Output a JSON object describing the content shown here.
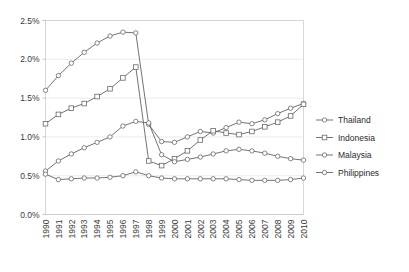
{
  "chart_data": {
    "type": "line",
    "title": "",
    "xlabel": "",
    "ylabel": "",
    "grid": true,
    "legend_position": "right",
    "x": [
      "1990",
      "1991",
      "1992",
      "1993",
      "1994",
      "1995",
      "1996",
      "1997",
      "1998",
      "1999",
      "2000",
      "2001",
      "2002",
      "2003",
      "2004",
      "2005",
      "2006",
      "2007",
      "2008",
      "2009",
      "2010"
    ],
    "categories": [
      "1990",
      "1991",
      "1992",
      "1993",
      "1994",
      "1995",
      "1996",
      "1997",
      "1998",
      "1999",
      "2000",
      "2001",
      "2002",
      "2003",
      "2004",
      "2005",
      "2006",
      "2007",
      "2008",
      "2009",
      "2010"
    ],
    "ylim": [
      0.0,
      2.5
    ],
    "ytick_labels": [
      "0.0%",
      "0.5%",
      "1.0%",
      "1.5%",
      "2.0%",
      "2.5%"
    ],
    "ytick_values": [
      0.0,
      0.5,
      1.0,
      1.5,
      2.0,
      2.5
    ],
    "yunit": "%",
    "series": [
      {
        "name": "Thailand",
        "marker": "circle",
        "values": [
          1.6,
          1.79,
          1.95,
          2.09,
          2.21,
          2.3,
          2.35,
          2.34,
          1.16,
          0.94,
          0.93,
          1.0,
          1.07,
          1.05,
          1.12,
          1.19,
          1.17,
          1.22,
          1.3,
          1.37,
          1.43
        ]
      },
      {
        "name": "Indonesia",
        "marker": "square",
        "values": [
          1.17,
          1.29,
          1.37,
          1.43,
          1.52,
          1.62,
          1.76,
          1.9,
          0.69,
          0.63,
          0.72,
          0.82,
          0.96,
          1.08,
          1.05,
          1.03,
          1.07,
          1.13,
          1.19,
          1.27,
          1.42
        ]
      },
      {
        "name": "Malaysia",
        "marker": "circle",
        "values": [
          0.56,
          0.69,
          0.78,
          0.86,
          0.93,
          1.0,
          1.14,
          1.2,
          1.18,
          0.77,
          0.68,
          0.71,
          0.74,
          0.78,
          0.82,
          0.84,
          0.82,
          0.79,
          0.75,
          0.72,
          0.7
        ]
      },
      {
        "name": "Philippines",
        "marker": "circle",
        "values": [
          0.52,
          0.45,
          0.46,
          0.47,
          0.47,
          0.48,
          0.5,
          0.55,
          0.5,
          0.47,
          0.46,
          0.46,
          0.46,
          0.46,
          0.46,
          0.45,
          0.44,
          0.44,
          0.44,
          0.45,
          0.47
        ]
      }
    ],
    "legend": [
      "Thailand",
      "Indonesia",
      "Malaysia",
      "Philippines"
    ],
    "colors": {
      "line": "#5a5a5a",
      "marker_stroke": "#6a6a6a",
      "marker_fill": "#ffffff",
      "grid": "#e2e2e2",
      "axis": "#b9b9b9",
      "text": "#2b2b2b"
    }
  }
}
